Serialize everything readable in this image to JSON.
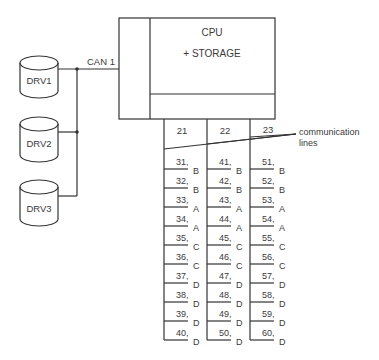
{
  "cpu": {
    "title": "CPU",
    "subtitle": "+ STORAGE"
  },
  "bus": {
    "label": "CAN 1"
  },
  "drives": [
    {
      "id": "drv1",
      "label": "DRV1"
    },
    {
      "id": "drv2",
      "label": "DRV2"
    },
    {
      "id": "drv3",
      "label": "DRV3"
    }
  ],
  "annotation": {
    "line1": "communication",
    "line2": "lines"
  },
  "columns": [
    {
      "header": "21",
      "rows": [
        {
          "num": "31,",
          "type": "B"
        },
        {
          "num": "32,",
          "type": "B"
        },
        {
          "num": "33,",
          "type": "A"
        },
        {
          "num": "34,",
          "type": "A"
        },
        {
          "num": "35,",
          "type": "C"
        },
        {
          "num": "36,",
          "type": "C"
        },
        {
          "num": "37,",
          "type": "D"
        },
        {
          "num": "38,",
          "type": "D"
        },
        {
          "num": "39,",
          "type": "D"
        },
        {
          "num": "40,",
          "type": "D"
        }
      ]
    },
    {
      "header": "22",
      "rows": [
        {
          "num": "41,",
          "type": "B"
        },
        {
          "num": "42,",
          "type": "B"
        },
        {
          "num": "43,",
          "type": "A"
        },
        {
          "num": "44,",
          "type": "A"
        },
        {
          "num": "45,",
          "type": "C"
        },
        {
          "num": "46,",
          "type": "C"
        },
        {
          "num": "47,",
          "type": "D"
        },
        {
          "num": "48,",
          "type": "D"
        },
        {
          "num": "49,",
          "type": "D"
        },
        {
          "num": "50,",
          "type": "D"
        }
      ]
    },
    {
      "header": "23",
      "rows": [
        {
          "num": "51,",
          "type": "B"
        },
        {
          "num": "52,",
          "type": "B"
        },
        {
          "num": "53,",
          "type": "A"
        },
        {
          "num": "54,",
          "type": "A"
        },
        {
          "num": "55,",
          "type": "C"
        },
        {
          "num": "56,",
          "type": "C"
        },
        {
          "num": "57,",
          "type": "D"
        },
        {
          "num": "58,",
          "type": "D"
        },
        {
          "num": "59,",
          "type": "D"
        },
        {
          "num": "60,",
          "type": "D"
        }
      ]
    }
  ]
}
